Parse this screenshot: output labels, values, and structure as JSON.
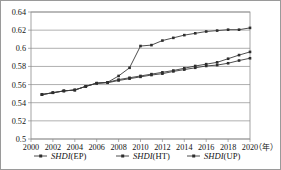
{
  "chart_data": {
    "type": "line",
    "title": "",
    "xlabel": "年",
    "ylabel": "",
    "ylim": [
      0.5,
      0.64
    ],
    "xlim": [
      2000,
      2020
    ],
    "grid": true,
    "legend_position": "bottom",
    "ytick_labels": [
      "0.5",
      "0.52",
      "0.54",
      "0.56",
      "0.58",
      "0.6",
      "0.62",
      "0.64"
    ],
    "ytick_values": [
      0.5,
      0.52,
      0.54,
      0.56,
      0.58,
      0.6,
      0.62,
      0.64
    ],
    "xtick_labels": [
      "2000",
      "2002",
      "2004",
      "2006",
      "2008",
      "2010",
      "2012",
      "2014",
      "2016",
      "2018",
      "2020"
    ],
    "xtick_values": [
      2000,
      2002,
      2004,
      2006,
      2008,
      2010,
      2012,
      2014,
      2016,
      2018,
      2020
    ],
    "x": [
      2001,
      2002,
      2003,
      2004,
      2005,
      2006,
      2007,
      2008,
      2009,
      2010,
      2011,
      2012,
      2013,
      2014,
      2015,
      2016,
      2017,
      2018,
      2019,
      2020
    ],
    "series": [
      {
        "name": "SHDI(EP)",
        "name_italic": "SHDI",
        "name_plain": "(EP)",
        "marker": "square",
        "color": "#3a3a3a",
        "values": [
          0.549,
          0.551,
          0.553,
          0.554,
          0.558,
          0.5615,
          0.562,
          0.5645,
          0.5665,
          0.5685,
          0.5705,
          0.572,
          0.5745,
          0.5765,
          0.5785,
          0.5805,
          0.5815,
          0.5835,
          0.5865,
          0.589
        ]
      },
      {
        "name": "SHDI(HT)",
        "name_italic": "SHDI",
        "name_plain": "(HT)",
        "marker": "square",
        "color": "#3a3a3a",
        "values": [
          0.549,
          0.551,
          0.553,
          0.554,
          0.558,
          0.5615,
          0.5625,
          0.5695,
          0.5785,
          0.6025,
          0.6035,
          0.6085,
          0.6115,
          0.6145,
          0.6165,
          0.6185,
          0.6195,
          0.6205,
          0.6205,
          0.6225
        ]
      },
      {
        "name": "SHDI(UP)",
        "name_italic": "SHDI",
        "name_plain": "(UP)",
        "marker": "square",
        "color": "#3a3a3a",
        "values": [
          0.549,
          0.551,
          0.553,
          0.554,
          0.558,
          0.5615,
          0.5625,
          0.5655,
          0.5675,
          0.5695,
          0.5715,
          0.5735,
          0.5755,
          0.578,
          0.5805,
          0.5825,
          0.5845,
          0.5885,
          0.5925,
          0.596
        ]
      }
    ]
  }
}
